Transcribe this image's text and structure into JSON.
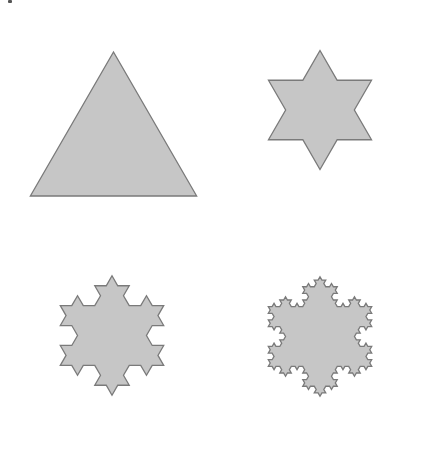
{
  "figure": {
    "fill_color": "#c6c6c6",
    "stroke_color": "#7a7a7a",
    "stroke_width": 1.3,
    "shapes": [
      {
        "name": "iteration-0-triangle",
        "iteration": 0,
        "cx": 113.5,
        "cy": 148,
        "radius": 96,
        "rotation": -90
      },
      {
        "name": "iteration-1-star",
        "iteration": 1,
        "cx": 320,
        "cy": 110,
        "radius": 59.5,
        "rotation": -90
      },
      {
        "name": "iteration-2-snowflake",
        "iteration": 2,
        "cx": 112,
        "cy": 335.5,
        "radius": 59.7,
        "rotation": -90
      },
      {
        "name": "iteration-3-snowflake",
        "iteration": 3,
        "cx": 320,
        "cy": 336.5,
        "radius": 59.7,
        "rotation": -90
      }
    ]
  }
}
